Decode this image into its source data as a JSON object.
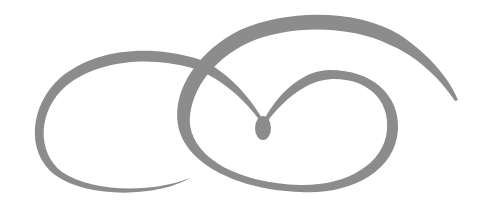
{
  "image": {
    "description": "Decorative calligraphic swirl flourish",
    "background": "#ffffff",
    "stroke_color": "#8c8c8c",
    "elements": [
      "left-loop",
      "right-loop",
      "top-arc",
      "teardrop"
    ]
  }
}
